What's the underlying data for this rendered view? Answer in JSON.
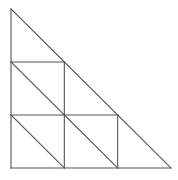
{
  "diagram": {
    "grid_size": 3,
    "line_color": "#555555",
    "background": "#ffffff",
    "cells": [
      {
        "row": 1,
        "col": 0
      },
      {
        "row": 2,
        "col": 0
      },
      {
        "row": 2,
        "col": 1
      }
    ],
    "outer_triangle": true,
    "labels": []
  }
}
